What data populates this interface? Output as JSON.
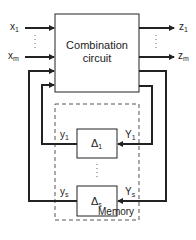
{
  "diagram": {
    "combination_circuit": {
      "line1": "Combination",
      "line2": "circuit"
    },
    "inputs": [
      {
        "base": "x",
        "sub": "1"
      },
      {
        "base": "x",
        "sub": "m"
      }
    ],
    "outputs": [
      {
        "base": "z",
        "sub": "1"
      },
      {
        "base": "z",
        "sub": "m"
      }
    ],
    "memory": {
      "label": "Memory",
      "delays": [
        {
          "base": "Δ",
          "sub": "1",
          "in": {
            "base": "Y",
            "sub": "1"
          },
          "out": {
            "base": "y",
            "sub": "1"
          }
        },
        {
          "base": "Δ",
          "sub": "s",
          "in": {
            "base": "Y",
            "sub": "s"
          },
          "out": {
            "base": "y",
            "sub": "s"
          }
        }
      ]
    },
    "ellipsis": "⋮"
  }
}
